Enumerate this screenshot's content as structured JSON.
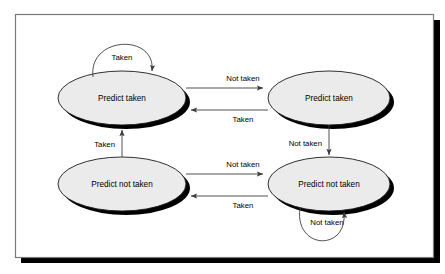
{
  "figure": {
    "kind": "state-transition-diagram",
    "frame": {
      "border_color": "#7a7a7a",
      "background": "#ffffff",
      "shadow_color": "#000000"
    },
    "style": {
      "state_fill": "#ebebeb",
      "state_stroke": "#1a1a1a",
      "state_shadow": "#000000",
      "edge_color": "#3c3c3c",
      "text_color": "#000000"
    }
  },
  "states": [
    {
      "id": "strongly-taken",
      "label": "Predict taken",
      "cx": 122,
      "cy": 98,
      "rx": 64,
      "ry": 27
    },
    {
      "id": "weakly-taken",
      "label": "Predict taken",
      "cx": 329,
      "cy": 98,
      "rx": 61,
      "ry": 27
    },
    {
      "id": "weakly-not-taken",
      "label": "Predict not taken",
      "cx": 122,
      "cy": 184,
      "rx": 64,
      "ry": 27
    },
    {
      "id": "strongly-not-taken",
      "label": "Predict not taken",
      "cx": 329,
      "cy": 184,
      "rx": 61,
      "ry": 27
    }
  ],
  "transitions": [
    {
      "id": "st-self-taken",
      "from": "strongly-taken",
      "to": "strongly-taken",
      "label": "Taken",
      "label_x": 122,
      "label_y": 57,
      "kind": "self-loop-top"
    },
    {
      "id": "st-to-wt",
      "from": "strongly-taken",
      "to": "weakly-taken",
      "label": "Not taken",
      "label_x": 243,
      "label_y": 78,
      "kind": "straight-right"
    },
    {
      "id": "wt-to-st",
      "from": "weakly-taken",
      "to": "strongly-taken",
      "label": "Taken",
      "label_x": 243,
      "label_y": 118,
      "kind": "straight-left"
    },
    {
      "id": "wt-to-snt",
      "from": "weakly-taken",
      "to": "strongly-not-taken",
      "label": "Not taken",
      "label_x": 304,
      "label_y": 144,
      "kind": "straight-down"
    },
    {
      "id": "wnt-to-snt",
      "from": "weakly-not-taken",
      "to": "strongly-not-taken",
      "label": "Not taken",
      "label_x": 243,
      "label_y": 164,
      "kind": "straight-right"
    },
    {
      "id": "snt-to-wnt",
      "from": "strongly-not-taken",
      "to": "weakly-not-taken",
      "label": "Taken",
      "label_x": 243,
      "label_y": 203,
      "kind": "straight-left"
    },
    {
      "id": "wnt-to-st",
      "from": "weakly-not-taken",
      "to": "strongly-taken",
      "label": "Taken",
      "label_x": 97,
      "label_y": 144,
      "kind": "straight-up"
    },
    {
      "id": "snt-self-not-taken",
      "from": "strongly-not-taken",
      "to": "strongly-not-taken",
      "label": "Not taken",
      "label_x": 329,
      "label_y": 222,
      "kind": "self-loop-bottom"
    }
  ]
}
